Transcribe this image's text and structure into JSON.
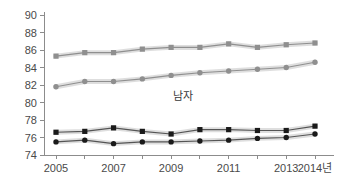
{
  "chart_data": {
    "type": "line",
    "title": "",
    "subtitle": "",
    "xlabel": "",
    "ylabel": "",
    "x": [
      2005,
      2006,
      2007,
      2008,
      2009,
      2010,
      2011,
      2012,
      2013,
      2014
    ],
    "xtick_labels": [
      "2005",
      "",
      "2007",
      "",
      "2009",
      "",
      "2011",
      "",
      "2013",
      "2014년"
    ],
    "ytick_labels": [
      "74",
      "76",
      "78",
      "80",
      "82",
      "84",
      "86",
      "88",
      "90"
    ],
    "ytick_values": [
      74,
      76,
      78,
      80,
      82,
      84,
      86,
      88,
      90
    ],
    "ylim": [
      74,
      90
    ],
    "xlim": [
      2005,
      2014
    ],
    "grid": false,
    "legend_position": "none",
    "annotations": [
      {
        "text": "남자",
        "x": 2009.4,
        "y": 80.3
      }
    ],
    "series": [
      {
        "name": "gray-square-upper",
        "marker": "square",
        "color": "#8f8f8f",
        "line_color": "#8f8f8f",
        "values": [
          85.3,
          85.7,
          85.7,
          86.1,
          86.3,
          86.3,
          86.7,
          86.3,
          86.6,
          86.8
        ]
      },
      {
        "name": "gray-circle-upper",
        "marker": "circle",
        "color": "#8f8f8f",
        "line_color": "#8f8f8f",
        "values": [
          81.8,
          82.4,
          82.4,
          82.7,
          83.1,
          83.4,
          83.6,
          83.8,
          84.0,
          84.6
        ]
      },
      {
        "name": "black-square-lower",
        "marker": "square",
        "color": "#1a1a1a",
        "line_color": "#555555",
        "values": [
          76.6,
          76.7,
          77.1,
          76.7,
          76.4,
          76.9,
          76.9,
          76.8,
          76.8,
          77.3
        ]
      },
      {
        "name": "black-circle-lower",
        "marker": "circle",
        "color": "#1a1a1a",
        "line_color": "#555555",
        "values": [
          75.5,
          75.7,
          75.3,
          75.5,
          75.5,
          75.6,
          75.7,
          75.9,
          76.0,
          76.4
        ]
      }
    ],
    "colors": {
      "axis": "#8c8c8c",
      "tick_text": "#4a4a4a",
      "gray_series": "#8f8f8f",
      "dark_series": "#1a1a1a",
      "halo": "#d8d8d8",
      "background": "#ffffff"
    }
  }
}
